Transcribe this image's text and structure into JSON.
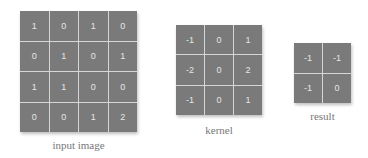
{
  "input": {
    "label": "input image",
    "rows": [
      [
        "1",
        "0",
        "1",
        "0"
      ],
      [
        "0",
        "1",
        "0",
        "1"
      ],
      [
        "1",
        "1",
        "0",
        "0"
      ],
      [
        "0",
        "0",
        "1",
        "2"
      ]
    ]
  },
  "kernel": {
    "label": "kernel",
    "rows": [
      [
        "-1",
        "0",
        "1"
      ],
      [
        "-2",
        "0",
        "2"
      ],
      [
        "-1",
        "0",
        "1"
      ]
    ]
  },
  "result": {
    "label": "result",
    "rows": [
      [
        "-1",
        "-1"
      ],
      [
        "-1",
        "0"
      ]
    ]
  },
  "colors": {
    "cell_bg": "#7a7a7a",
    "grid_line": "#d6d6d6",
    "cell_text": "#e6e6e6",
    "label_text": "#777777"
  }
}
